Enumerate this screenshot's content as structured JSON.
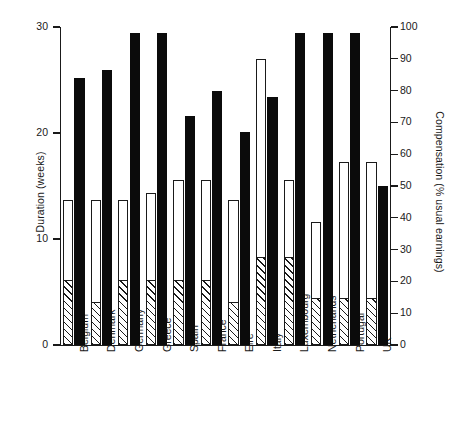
{
  "chart_data": {
    "type": "bar",
    "title": "",
    "subtitle": "",
    "categories": [
      "Belgium",
      "Denmark",
      "Germany",
      "Greece",
      "Spain",
      "France",
      "Eire",
      "Italy",
      "Luxembourg",
      "Netherlands",
      "Portugal",
      "UK"
    ],
    "xlabel": "",
    "ylabel": "Duration (weeks)",
    "y2label": "Compensation (% usual earnings)",
    "ylim": [
      0,
      30
    ],
    "y2lim": [
      0,
      100
    ],
    "yticks": [
      0,
      10,
      20,
      30
    ],
    "ytick_labels": [
      "0",
      "10",
      "20",
      "30"
    ],
    "y2ticks": [
      0,
      10,
      20,
      30,
      40,
      50,
      60,
      70,
      80,
      90,
      100
    ],
    "y2tick_labels": [
      "0",
      "10",
      "20",
      "30",
      "40",
      "50",
      "60",
      "70",
      "80",
      "90",
      "100"
    ],
    "grid": false,
    "legend": null,
    "legend_position": "none",
    "series": [
      {
        "name": "Total duration (weeks)",
        "axis": "left",
        "style": "open-bar",
        "units": "weeks",
        "values": [
          13.7,
          13.7,
          13.7,
          14.3,
          15.6,
          15.6,
          13.7,
          27.0,
          15.6,
          11.6,
          17.3,
          17.3
        ]
      },
      {
        "name": "Initial/full-rate duration (weeks)",
        "axis": "left",
        "style": "hatched-bar",
        "units": "weeks",
        "values": [
          6.0,
          4.0,
          6.0,
          6.0,
          6.0,
          6.0,
          4.0,
          8.2,
          8.2,
          4.3,
          4.3,
          4.3
        ]
      },
      {
        "name": "Compensation (% usual earnings)",
        "axis": "right",
        "style": "solid-black-bar",
        "units": "%",
        "values": [
          84,
          86.5,
          98,
          98,
          72,
          80,
          67,
          78,
          98,
          98,
          98,
          50
        ]
      }
    ]
  },
  "axes": {
    "left": {
      "label": "Duration (weeks)"
    },
    "right": {
      "label": "Compensation (% usual earnings)"
    }
  },
  "colors": {
    "ink": "#1a1a1a",
    "bar_solid": "#0b0b0b",
    "bar_open": "#ffffff",
    "background": "#ffffff"
  }
}
